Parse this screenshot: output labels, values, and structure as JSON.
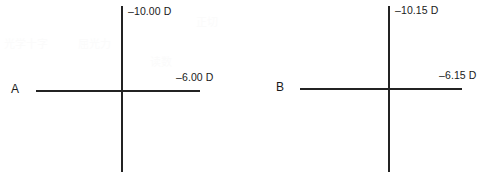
{
  "figure": {
    "background_color": "#ffffff",
    "line_color": "#232323",
    "text_color": "#1a1a1a"
  },
  "chart_data": {
    "type": "diagram",
    "title": "",
    "subtitle": "",
    "xlabel": "",
    "ylabel": "",
    "diagram_kind": "optical-power-cross",
    "unit": "D",
    "panels": [
      {
        "letter": "A",
        "vertical_label": "–10.00 D",
        "horizontal_label": "–6.00 D",
        "vertical_power": -10.0,
        "horizontal_power": -6.0,
        "vertical_meridian_deg": 90,
        "horizontal_meridian_deg": 180
      },
      {
        "letter": "B",
        "vertical_label": "–10.15 D",
        "horizontal_label": "–6.15 D",
        "vertical_power": -10.15,
        "horizontal_power": -6.15,
        "vertical_meridian_deg": 90,
        "horizontal_meridian_deg": 180
      }
    ]
  },
  "ghost_artifacts": {
    "fragment_1": "光学十字",
    "fragment_2": "屈光力",
    "fragment_3": "正切",
    "fragment_4": "读数"
  }
}
